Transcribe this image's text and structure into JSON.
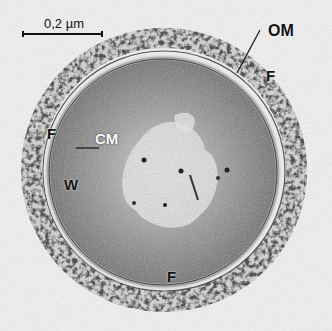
{
  "figure": {
    "type": "transmission electron micrograph",
    "scale_bar": {
      "label": "0,2 µm"
    },
    "labels": {
      "outer_membrane": "OM",
      "fibrils_top_right": "F",
      "fibrils_left": "F",
      "fibrils_bottom": "F",
      "cytoplasmic_membrane": "CM",
      "cell_wall": "W"
    },
    "colors": {
      "background": "#f4f4f4",
      "dense_granules": "#1a1a1a",
      "cytoplasm": "#7a7a7a",
      "nucleoid_light": "#e8e8e8",
      "label_text": "#111111"
    }
  }
}
